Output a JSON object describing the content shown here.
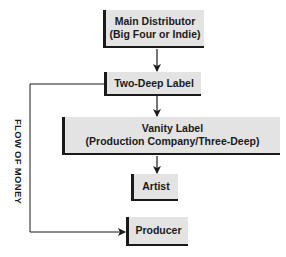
{
  "diagram": {
    "nodes": [
      {
        "id": "main-distributor",
        "line1": "Main Distributor",
        "line2": "(Big Four or Indie)"
      },
      {
        "id": "two-deep-label",
        "line1": "Two-Deep Label"
      },
      {
        "id": "vanity-label",
        "line1": "Vanity Label",
        "line2": "(Production Company/Three-Deep)"
      },
      {
        "id": "artist",
        "line1": "Artist"
      },
      {
        "id": "producer",
        "line1": "Producer"
      }
    ],
    "edges": [
      {
        "from": "main-distributor",
        "to": "two-deep-label"
      },
      {
        "from": "two-deep-label",
        "to": "vanity-label"
      },
      {
        "from": "vanity-label",
        "to": "artist"
      },
      {
        "from": "two-deep-label",
        "to": "producer"
      }
    ],
    "side_label": "FLOW OF MONEY",
    "colors": {
      "box_fill": "#e3e3e3",
      "line": "#1a1a1a",
      "background": "#ffffff"
    }
  }
}
